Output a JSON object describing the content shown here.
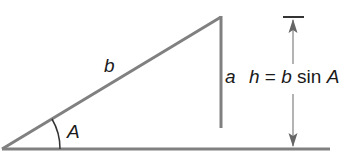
{
  "diagram": {
    "colors": {
      "line": "#808080",
      "text": "#1a1a1a",
      "background": "#ffffff"
    },
    "labels": {
      "side_b": "b",
      "side_a": "a",
      "angle_A": "A",
      "height_lhs": "h",
      "equals": " = ",
      "height_rhs_b": "b",
      "height_rhs_sin": " sin ",
      "height_rhs_A": "A"
    },
    "geometry": {
      "vertex_A": [
        2,
        149
      ],
      "apex": [
        221,
        17
      ],
      "side_a_bottom": [
        221,
        127
      ],
      "baseline_end": [
        330,
        149
      ],
      "height_marker_x": 293,
      "height_marker_top": 17,
      "height_marker_bottom": 149
    }
  }
}
